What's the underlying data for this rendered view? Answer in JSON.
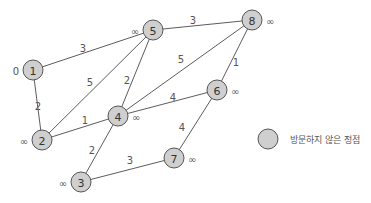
{
  "diagram": {
    "type": "weighted-undirected-graph",
    "nodes": [
      {
        "id": "1",
        "label": "1",
        "x": 33,
        "y": 70,
        "dist": "0",
        "dist_side": "left"
      },
      {
        "id": "2",
        "label": "2",
        "x": 42,
        "y": 140,
        "dist": "∞",
        "dist_side": "left"
      },
      {
        "id": "3",
        "label": "3",
        "x": 81,
        "y": 182,
        "dist": "∞",
        "dist_side": "left"
      },
      {
        "id": "4",
        "label": "4",
        "x": 118,
        "y": 116,
        "dist": "∞",
        "dist_side": "right"
      },
      {
        "id": "5",
        "label": "5",
        "x": 153,
        "y": 30,
        "dist": "∞",
        "dist_side": "left"
      },
      {
        "id": "6",
        "label": "6",
        "x": 217,
        "y": 90,
        "dist": "∞",
        "dist_side": "right"
      },
      {
        "id": "7",
        "label": "7",
        "x": 174,
        "y": 158,
        "dist": "∞",
        "dist_side": "right"
      },
      {
        "id": "8",
        "label": "8",
        "x": 252,
        "y": 20,
        "dist": "∞",
        "dist_side": "right"
      }
    ],
    "edges": [
      {
        "from": "1",
        "to": "5",
        "weight": "3",
        "lx": 83,
        "ly": 48
      },
      {
        "from": "1",
        "to": "2",
        "weight": "2",
        "lx": 38,
        "ly": 106
      },
      {
        "from": "2",
        "to": "5",
        "weight": "5",
        "lx": 90,
        "ly": 82
      },
      {
        "from": "2",
        "to": "4",
        "weight": "1",
        "lx": 85,
        "ly": 120
      },
      {
        "from": "4",
        "to": "5",
        "weight": "2",
        "lx": 127,
        "ly": 80
      },
      {
        "from": "4",
        "to": "8",
        "weight": "5",
        "lx": 181,
        "ly": 59
      },
      {
        "from": "4",
        "to": "6",
        "weight": "4",
        "lx": 173,
        "ly": 97
      },
      {
        "from": "5",
        "to": "8",
        "weight": "3",
        "lx": 193,
        "ly": 20
      },
      {
        "from": "6",
        "to": "8",
        "weight": "1",
        "lx": 236,
        "ly": 62
      },
      {
        "from": "3",
        "to": "4",
        "weight": "2",
        "lx": 92,
        "ly": 150
      },
      {
        "from": "3",
        "to": "7",
        "weight": "3",
        "lx": 130,
        "ly": 160
      },
      {
        "from": "6",
        "to": "7",
        "weight": "4",
        "lx": 182,
        "ly": 127
      }
    ],
    "node_radius": 10
  },
  "legend": {
    "items": [
      {
        "label": "방문하지 않은 정점",
        "color": "#cfcfcf"
      }
    ]
  },
  "colors": {
    "node_fill": "#cfcfcf",
    "node_stroke": "#555555",
    "edge": "#4a4a4a",
    "text": "#555555"
  }
}
